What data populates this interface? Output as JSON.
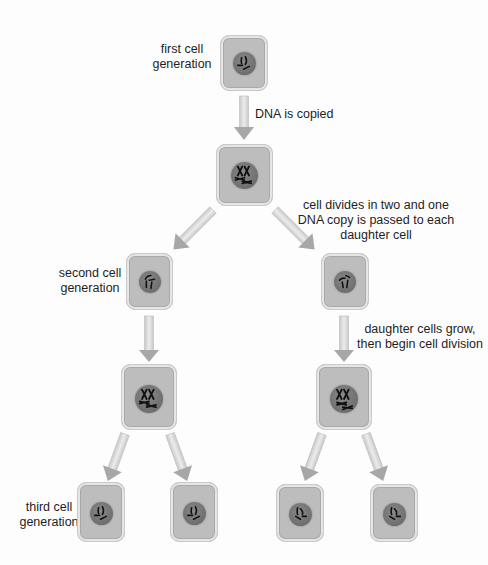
{
  "labels": {
    "first_generation": "first cell\ngeneration",
    "dna_copied": "DNA is copied",
    "cell_divides": "cell divides in two and one\nDNA copy is passed to each\ndaughter cell",
    "second_generation": "second cell\ngeneration",
    "daughter_grow": "daughter cells grow,\nthen begin cell division",
    "third_generation": "third cell\ngeneration"
  },
  "colors": {
    "cell_fill": "#bdbdbd",
    "cell_border": "#a9a9a9",
    "nucleus": "#6e6e6e",
    "chromosome": "#111111",
    "arrow_shaft": "#d9d9d9",
    "arrow_head": "#a5a5a5",
    "background": "#fdfdfd"
  },
  "cells": [
    {
      "id": "gen1",
      "generation": 1,
      "state": "single-chromosomes"
    },
    {
      "id": "gen1-copied",
      "generation": 1,
      "state": "duplicated-chromosomes"
    },
    {
      "id": "gen2-left",
      "generation": 2,
      "state": "single-chromosomes"
    },
    {
      "id": "gen2-right",
      "generation": 2,
      "state": "single-chromosomes"
    },
    {
      "id": "gen2-left-copied",
      "generation": 2,
      "state": "duplicated-chromosomes"
    },
    {
      "id": "gen2-right-copied",
      "generation": 2,
      "state": "duplicated-chromosomes"
    },
    {
      "id": "gen3-1",
      "generation": 3,
      "state": "single-chromosomes"
    },
    {
      "id": "gen3-2",
      "generation": 3,
      "state": "single-chromosomes"
    },
    {
      "id": "gen3-3",
      "generation": 3,
      "state": "single-chromosomes"
    },
    {
      "id": "gen3-4",
      "generation": 3,
      "state": "single-chromosomes"
    }
  ]
}
